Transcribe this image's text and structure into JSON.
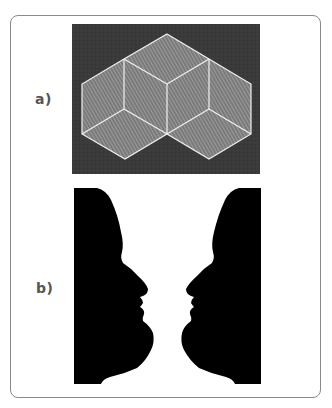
{
  "figure": {
    "panels": [
      {
        "label": "a)",
        "description": "Necker-style stacked isometric cubes with hatched faces on dark background",
        "colors": {
          "background": "#3a3a3a",
          "face_fill": "#8c8c8c",
          "edge": "#f2f2f2"
        }
      },
      {
        "label": "b)",
        "description": "Rubin vase / two facing face profiles silhouette",
        "colors": {
          "silhouette": "#000000",
          "background": "#ffffff"
        }
      }
    ],
    "colors": {
      "card_border": "#8a8a8a",
      "label_text": "#555555"
    }
  }
}
